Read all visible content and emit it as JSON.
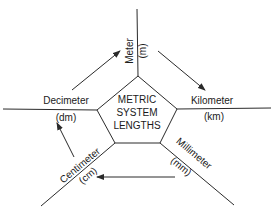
{
  "center": {
    "lines": [
      "METRIC",
      "SYSTEM",
      "LENGTHS"
    ]
  },
  "units": {
    "meter": {
      "name": "Meter",
      "abbr": "(m)"
    },
    "kilometer": {
      "name": "Kilometer",
      "abbr": "(km)"
    },
    "millimeter": {
      "name": "Millimeter",
      "abbr": "(mm)"
    },
    "centimeter": {
      "name": "Centimeter",
      "abbr": "(cm)"
    },
    "decimeter": {
      "name": "Decimeter",
      "abbr": "(dm)"
    }
  },
  "arrows": [
    {
      "from": "Decimeter",
      "to": "Meter"
    },
    {
      "from": "Meter",
      "to": "Kilometer"
    },
    {
      "from": "Millimeter",
      "to": "Centimeter"
    },
    {
      "from": "Centimeter",
      "to": "Decimeter"
    }
  ],
  "colors": {
    "line": "#2a2a2a",
    "text": "#1a1a1a",
    "background": "#ffffff"
  }
}
